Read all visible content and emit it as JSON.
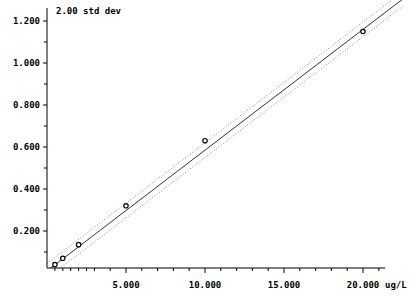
{
  "chart_data": {
    "type": "scatter",
    "title": "",
    "annotation": "2.00 std dev",
    "xlabel": "ug/L",
    "ylabel": "",
    "xlim": [
      0,
      21.5
    ],
    "ylim": [
      0,
      1.25
    ],
    "x_ticks": [
      "5.000",
      "10.000",
      "15.000",
      "20.000"
    ],
    "x_tick_values": [
      5,
      10,
      15,
      20
    ],
    "y_ticks": [
      "0.200",
      "0.400",
      "0.600",
      "0.800",
      "1.000",
      "1.200"
    ],
    "y_tick_values": [
      0.2,
      0.4,
      0.6,
      0.8,
      1.0,
      1.2
    ],
    "grid": false,
    "legend": null,
    "series": [
      {
        "name": "calibration standards",
        "marker": "o",
        "x": [
          0.5,
          1.0,
          2.0,
          5.0,
          10.0,
          20.0
        ],
        "y": [
          0.04,
          0.07,
          0.135,
          0.32,
          0.63,
          1.15
        ]
      }
    ],
    "fit_line": {
      "name": "regression",
      "style": "solid",
      "slope": 0.0575,
      "intercept": 0.01
    },
    "confidence_bands": {
      "name": "2.00 std dev",
      "style": "dotted",
      "offset": 0.035
    },
    "colors": {
      "axis": "#000000",
      "line": "#333333",
      "band": "#888888",
      "marker": "#000000"
    }
  }
}
